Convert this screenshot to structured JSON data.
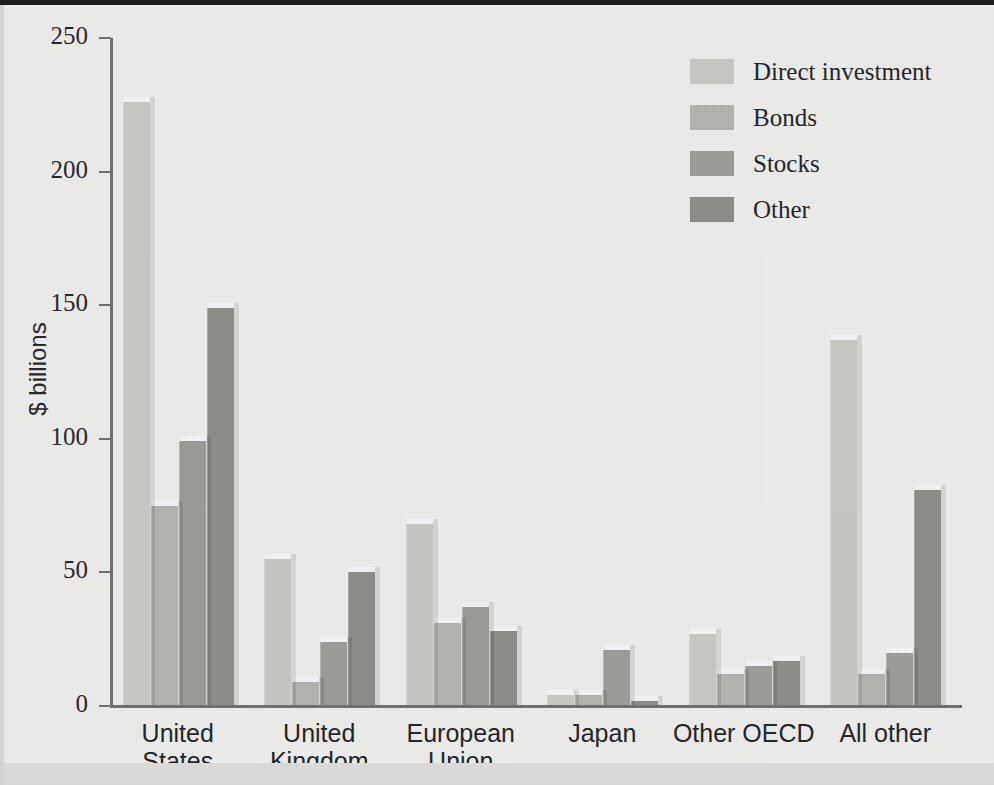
{
  "chart_data": {
    "type": "bar",
    "title": "",
    "subtitle": "",
    "xlabel": "",
    "ylabel": "$ billions",
    "ylim": [
      0,
      250
    ],
    "yticks": [
      0,
      50,
      100,
      150,
      200,
      250
    ],
    "grid": false,
    "legend_position": "top-right",
    "categories": [
      "United States",
      "United Kingdom",
      "European Union",
      "Japan",
      "Other OECD",
      "All other"
    ],
    "category_lines": [
      [
        "United",
        "States"
      ],
      [
        "United",
        "Kingdom"
      ],
      [
        "European",
        "Union"
      ],
      [
        "Japan"
      ],
      [
        "Other OECD"
      ],
      [
        "All other"
      ]
    ],
    "series": [
      {
        "name": "Direct investment",
        "color": "#c6c6c3",
        "values": [
          226,
          55,
          68,
          4,
          27,
          137
        ]
      },
      {
        "name": "Bonds",
        "color": "#b2b2ae",
        "values": [
          75,
          9,
          31,
          4,
          12,
          12
        ]
      },
      {
        "name": "Stocks",
        "color": "#9b9b97",
        "values": [
          99,
          24,
          37,
          21,
          15,
          20
        ]
      },
      {
        "name": "Other",
        "color": "#8c8c88",
        "values": [
          149,
          50,
          28,
          2,
          17,
          81
        ]
      }
    ]
  },
  "axis": {
    "y_title": "$ billions",
    "tick_labels": [
      "250",
      "200",
      "150",
      "100",
      "50",
      "0"
    ]
  },
  "legend": {
    "items": [
      {
        "label": "Direct investment",
        "color": "#c6c6c3"
      },
      {
        "label": "Bonds",
        "color": "#b2b2ae"
      },
      {
        "label": "Stocks",
        "color": "#9b9b97"
      },
      {
        "label": "Other",
        "color": "#8c8c88"
      }
    ]
  }
}
